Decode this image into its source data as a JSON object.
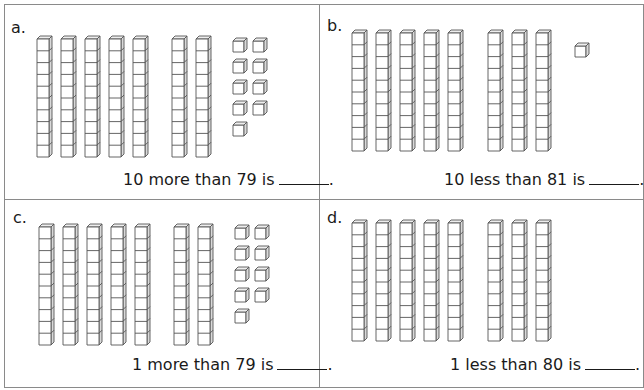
{
  "worksheet": {
    "panels": [
      {
        "id": "a",
        "label": "a.",
        "tens": 7,
        "ones": 9,
        "represented_number": 79,
        "prompt": "10 more than 79 is",
        "answer_blank": "",
        "period": "."
      },
      {
        "id": "b",
        "label": "b.",
        "tens": 8,
        "ones": 1,
        "represented_number": 81,
        "prompt": "10 less than 81 is",
        "answer_blank": "",
        "period": "."
      },
      {
        "id": "c",
        "label": "c.",
        "tens": 7,
        "ones": 9,
        "represented_number": 79,
        "prompt": "1 more than 79 is",
        "answer_blank": "",
        "period": "."
      },
      {
        "id": "d",
        "label": "d.",
        "tens": 8,
        "ones": 0,
        "represented_number": 80,
        "prompt": "1 less than 80 is",
        "answer_blank": "",
        "period": "."
      }
    ],
    "icons": {
      "tens_rod": "base-ten-rod-icon",
      "unit_cube": "base-ten-unit-cube-icon"
    },
    "colors": {
      "line": "#555555",
      "border": "#8a8a8a",
      "side_shade": "#d9d9d9",
      "top_shade": "#eeeeee",
      "text": "#1a1a1a"
    }
  }
}
